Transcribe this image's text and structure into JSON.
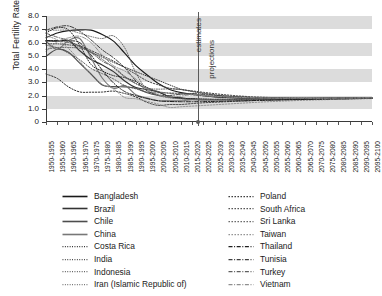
{
  "chart_data": {
    "type": "line",
    "title": "",
    "xlabel": "",
    "ylabel": "Total Fertility Rate",
    "ylim": [
      0,
      8
    ],
    "yticks": [
      "0",
      "1.0",
      "2.0",
      "3.0",
      "4.0",
      "5.0",
      "6.0",
      "7.0",
      "8.0"
    ],
    "grid": "alternating horizontal gray bands",
    "legend_position": "below-plot, two columns",
    "annotations": [
      {
        "text": "estimates",
        "position": "left of divider",
        "rotated": true
      },
      {
        "text": "projections",
        "position": "right of divider",
        "rotated": true
      }
    ],
    "divider_at": "2015-2020 / 2020-2025",
    "categories": [
      "1950-1955",
      "1955-1960",
      "1960-1965",
      "1965-1970",
      "1970-1975",
      "1975-1980",
      "1980-1985",
      "1985-1990",
      "1990-1995",
      "1995-2000",
      "2000-2005",
      "2005-2010",
      "2010-2015",
      "2015-2020",
      "2020-2025",
      "2025-2030",
      "2030-2035",
      "2035-2040",
      "2040-2045",
      "2045-2050",
      "2050-2055",
      "2055-2060",
      "2060-2065",
      "2065-2070",
      "2070-2075",
      "2075-2080",
      "2080-2085",
      "2085-2090",
      "2090-2095",
      "2095-2100"
    ],
    "series": [
      {
        "name": "Bangladesh",
        "style": "solid",
        "color": "#1a1a1a",
        "values": [
          6.36,
          6.72,
          6.9,
          6.95,
          6.93,
          6.6,
          6.1,
          5.2,
          4.25,
          3.55,
          2.9,
          2.45,
          2.22,
          2.1,
          1.98,
          1.9,
          1.85,
          1.81,
          1.79,
          1.77,
          1.76,
          1.75,
          1.75,
          1.75,
          1.75,
          1.76,
          1.76,
          1.77,
          1.78,
          1.79
        ]
      },
      {
        "name": "Brazil",
        "style": "solid",
        "color": "#333333",
        "values": [
          6.15,
          6.1,
          6.15,
          5.38,
          4.72,
          4.31,
          3.8,
          3.1,
          2.6,
          2.45,
          2.27,
          1.9,
          1.82,
          1.74,
          1.71,
          1.7,
          1.7,
          1.71,
          1.72,
          1.73,
          1.74,
          1.75,
          1.76,
          1.76,
          1.77,
          1.78,
          1.79,
          1.79,
          1.8,
          1.81
        ]
      },
      {
        "name": "Chile",
        "style": "solid",
        "color": "#4d4d4d",
        "values": [
          4.95,
          5.49,
          5.27,
          4.44,
          3.63,
          2.8,
          2.67,
          2.65,
          2.55,
          2.21,
          2.0,
          1.87,
          1.78,
          1.7,
          1.67,
          1.66,
          1.66,
          1.67,
          1.69,
          1.7,
          1.72,
          1.73,
          1.74,
          1.75,
          1.76,
          1.77,
          1.78,
          1.79,
          1.8,
          1.81
        ]
      },
      {
        "name": "China",
        "style": "solid",
        "color": "#777777",
        "values": [
          6.11,
          5.48,
          6.15,
          6.3,
          4.86,
          3.32,
          2.55,
          2.75,
          2.05,
          1.8,
          1.6,
          1.6,
          1.6,
          1.69,
          1.7,
          1.7,
          1.71,
          1.72,
          1.73,
          1.74,
          1.75,
          1.76,
          1.76,
          1.77,
          1.78,
          1.78,
          1.79,
          1.8,
          1.8,
          1.81
        ]
      },
      {
        "name": "Costa Rica",
        "style": "dotted-fine",
        "color": "#222222",
        "values": [
          6.72,
          7.11,
          6.95,
          5.8,
          4.35,
          3.85,
          3.5,
          3.35,
          3.05,
          2.6,
          2.25,
          1.93,
          1.8,
          1.76,
          1.73,
          1.71,
          1.71,
          1.71,
          1.72,
          1.73,
          1.74,
          1.75,
          1.76,
          1.77,
          1.77,
          1.78,
          1.79,
          1.8,
          1.8,
          1.81
        ]
      },
      {
        "name": "India",
        "style": "dotted-fine",
        "color": "#3b3b3b",
        "values": [
          5.9,
          5.9,
          5.82,
          5.69,
          5.26,
          4.89,
          4.5,
          4.15,
          3.8,
          3.46,
          3.14,
          2.8,
          2.48,
          2.3,
          2.15,
          2.03,
          1.95,
          1.89,
          1.85,
          1.82,
          1.8,
          1.79,
          1.78,
          1.78,
          1.78,
          1.78,
          1.79,
          1.79,
          1.8,
          1.81
        ]
      },
      {
        "name": "Indonesia",
        "style": "dotted-fine",
        "color": "#555555",
        "values": [
          5.49,
          5.62,
          5.62,
          5.57,
          5.3,
          4.73,
          4.11,
          3.4,
          2.9,
          2.55,
          2.48,
          2.5,
          2.45,
          2.32,
          2.18,
          2.06,
          1.97,
          1.91,
          1.86,
          1.83,
          1.81,
          1.8,
          1.79,
          1.79,
          1.79,
          1.79,
          1.8,
          1.8,
          1.81,
          1.81
        ]
      },
      {
        "name": "Iran (Islamic Republic of)",
        "style": "dotted-fine",
        "color": "#6b6b6b",
        "values": [
          6.93,
          6.93,
          6.93,
          6.7,
          6.45,
          6.3,
          6.5,
          5.6,
          3.7,
          2.43,
          2.0,
          1.82,
          1.75,
          1.7,
          1.68,
          1.68,
          1.69,
          1.7,
          1.71,
          1.72,
          1.74,
          1.75,
          1.76,
          1.77,
          1.78,
          1.78,
          1.79,
          1.8,
          1.8,
          1.81
        ]
      },
      {
        "name": "Poland",
        "style": "dotted-coarse",
        "color": "#2b2b2b",
        "values": [
          3.62,
          3.29,
          2.65,
          2.27,
          2.25,
          2.26,
          2.33,
          2.15,
          1.89,
          1.48,
          1.25,
          1.32,
          1.32,
          1.39,
          1.45,
          1.49,
          1.53,
          1.57,
          1.6,
          1.63,
          1.65,
          1.67,
          1.69,
          1.71,
          1.72,
          1.74,
          1.75,
          1.76,
          1.77,
          1.78
        ]
      },
      {
        "name": "South Africa",
        "style": "dotted-coarse",
        "color": "#444444",
        "values": [
          6.1,
          6.1,
          6.0,
          5.75,
          5.4,
          5.0,
          4.6,
          4.1,
          3.6,
          3.1,
          2.8,
          2.55,
          2.45,
          2.35,
          2.24,
          2.14,
          2.05,
          1.98,
          1.92,
          1.88,
          1.85,
          1.83,
          1.81,
          1.8,
          1.8,
          1.8,
          1.8,
          1.81,
          1.81,
          1.82
        ]
      },
      {
        "name": "Sri Lanka",
        "style": "dotted-coarse",
        "color": "#5c5c5c",
        "values": [
          5.8,
          5.6,
          5.2,
          4.7,
          4.05,
          3.65,
          3.25,
          2.75,
          2.5,
          2.25,
          2.2,
          2.2,
          2.15,
          2.05,
          1.97,
          1.91,
          1.87,
          1.84,
          1.82,
          1.8,
          1.79,
          1.79,
          1.79,
          1.79,
          1.79,
          1.8,
          1.8,
          1.81,
          1.81,
          1.82
        ]
      },
      {
        "name": "Taiwan",
        "style": "dotted-coarse",
        "color": "#8a8a8a",
        "values": [
          6.5,
          6.2,
          5.55,
          4.6,
          3.55,
          2.85,
          2.5,
          1.85,
          1.75,
          1.55,
          1.35,
          1.1,
          1.15,
          1.2,
          1.25,
          1.3,
          1.35,
          1.4,
          1.45,
          1.5,
          1.54,
          1.58,
          1.61,
          1.64,
          1.67,
          1.69,
          1.71,
          1.73,
          1.75,
          1.77
        ]
      },
      {
        "name": "Thailand",
        "style": "dash-dot",
        "color": "#1f1f1f",
        "values": [
          6.14,
          6.14,
          6.13,
          5.99,
          5.05,
          3.92,
          2.95,
          2.3,
          1.99,
          1.77,
          1.6,
          1.55,
          1.53,
          1.53,
          1.54,
          1.55,
          1.57,
          1.59,
          1.61,
          1.63,
          1.65,
          1.67,
          1.69,
          1.7,
          1.72,
          1.73,
          1.75,
          1.76,
          1.77,
          1.78
        ]
      },
      {
        "name": "Tunisia",
        "style": "dash-dot",
        "color": "#3f3f3f",
        "values": [
          6.93,
          7.18,
          7.25,
          6.85,
          6.2,
          5.45,
          4.85,
          4.1,
          3.1,
          2.35,
          2.05,
          2.0,
          2.1,
          2.15,
          2.08,
          2.01,
          1.95,
          1.9,
          1.86,
          1.83,
          1.81,
          1.8,
          1.79,
          1.79,
          1.79,
          1.8,
          1.8,
          1.81,
          1.81,
          1.82
        ]
      },
      {
        "name": "Turkey",
        "style": "dash-dot",
        "color": "#5f5f5f",
        "values": [
          6.7,
          6.4,
          6.15,
          5.7,
          5.25,
          4.6,
          4.15,
          3.45,
          2.9,
          2.55,
          2.3,
          2.15,
          2.12,
          2.07,
          2.0,
          1.94,
          1.89,
          1.86,
          1.83,
          1.81,
          1.8,
          1.79,
          1.79,
          1.79,
          1.79,
          1.8,
          1.8,
          1.81,
          1.81,
          1.82
        ]
      },
      {
        "name": "Vietnam",
        "style": "dash-dot",
        "color": "#8f8f8f",
        "values": [
          5.35,
          6.05,
          6.35,
          6.47,
          6.0,
          5.05,
          4.25,
          3.85,
          3.23,
          2.5,
          2.05,
          1.9,
          1.96,
          2.06,
          2.0,
          1.94,
          1.9,
          1.86,
          1.84,
          1.82,
          1.81,
          1.8,
          1.8,
          1.8,
          1.8,
          1.8,
          1.81,
          1.81,
          1.82,
          1.82
        ]
      }
    ]
  },
  "legend": {
    "left_column": [
      {
        "label": "Bangladesh"
      },
      {
        "label": "Brazil"
      },
      {
        "label": "Chile"
      },
      {
        "label": "China"
      },
      {
        "label": "Costa Rica"
      },
      {
        "label": "India"
      },
      {
        "label": "Indonesia"
      },
      {
        "label": "Iran (Islamic Republic of)"
      }
    ],
    "right_column": [
      {
        "label": "Poland"
      },
      {
        "label": "South Africa"
      },
      {
        "label": "Sri Lanka"
      },
      {
        "label": "Taiwan"
      },
      {
        "label": "Thailand"
      },
      {
        "label": "Tunisia"
      },
      {
        "label": "Turkey"
      },
      {
        "label": "Vietnam"
      }
    ]
  },
  "annotations": {
    "estimates": "estimates",
    "projections": "projections"
  },
  "axis": {
    "y_title": "Total Fertility Rate"
  }
}
